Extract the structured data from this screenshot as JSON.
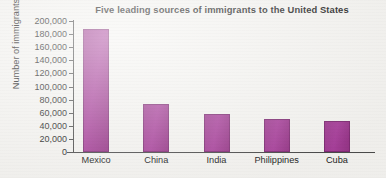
{
  "chart_data": {
    "type": "bar",
    "title": "Five leading sources of immigrants to the United States",
    "xlabel": "",
    "ylabel": "Number of immigrants",
    "categories": [
      "Mexico",
      "China",
      "India",
      "Philippines",
      "Cuba"
    ],
    "values": [
      188000,
      74000,
      58000,
      51000,
      47000
    ],
    "ylim": [
      0,
      200000
    ],
    "ytick_values": [
      0,
      20000,
      40000,
      60000,
      80000,
      100000,
      120000,
      140000,
      160000,
      180000,
      200000
    ],
    "ytick_labels": [
      "0",
      "20,000",
      "40,000",
      "60,000",
      "80,000",
      "100,000",
      "120,000",
      "140,000",
      "160,000",
      "180,000",
      "200,000"
    ],
    "grid": false,
    "legend": false,
    "legend_position": "none",
    "series": [
      {
        "name": "Number of immigrants",
        "values": [
          188000,
          74000,
          58000,
          51000,
          47000
        ]
      }
    ],
    "colors": {
      "bar_fill": "#a1399333",
      "bar_fill_solid": "#a03a93",
      "bar_edge": "#7e2b73",
      "axis": "#4a4a4a",
      "text": "#232323",
      "background": "#f4f3f0"
    }
  }
}
